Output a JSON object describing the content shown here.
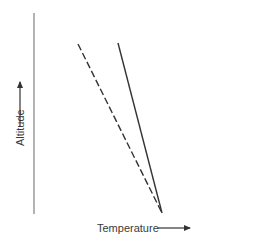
{
  "diagram": {
    "type": "lapse-rate-diagram",
    "axes": {
      "x_label": "Temperature",
      "y_label": "Altitude",
      "x_direction": "increasing-right",
      "y_direction": "increasing-up"
    },
    "lines": [
      {
        "name": "dashed-line",
        "style": "dashed",
        "relative_slope": "shallower"
      },
      {
        "name": "solid-line",
        "style": "solid",
        "relative_slope": "steeper"
      }
    ],
    "shared_origin": "lines meet at a common point on the temperature axis"
  },
  "colors": {
    "axis": "#8a8a8a",
    "line": "#333333",
    "text": "#3a3a3a",
    "axis_tint_end": "#9be08f"
  }
}
